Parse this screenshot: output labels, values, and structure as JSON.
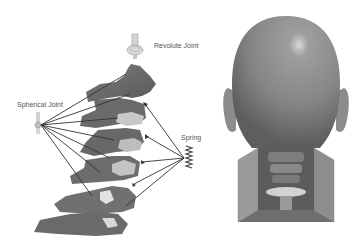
{
  "diagram": {
    "left_panel": {
      "name": "cervical-spine-model",
      "labels": {
        "revolute": "Revolute Joint",
        "spherical": "Spherical Joint",
        "spring": "Spring"
      }
    },
    "right_panel": {
      "name": "head-neck-model-rear-view"
    },
    "colors": {
      "vertebra": "#6f6f6f",
      "disc": "#c9c9c9",
      "lines": "#333333",
      "head": "#8a8a8a",
      "background": "#ffffff"
    }
  }
}
